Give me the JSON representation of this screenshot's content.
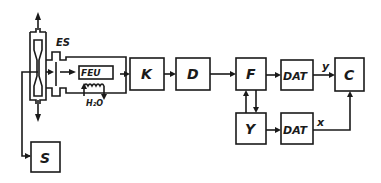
{
  "diagram": {
    "blocks": {
      "es": "ES",
      "feu": "FEU",
      "water": "H₂O",
      "k": "K",
      "d": "D",
      "f": "F",
      "dat_top": "DAT",
      "c": "C",
      "y": "Y",
      "dat_bottom": "DAT",
      "s": "S"
    },
    "signals": {
      "y_label": "y",
      "x_label": "x"
    },
    "colors": {
      "line": "#1a1a1a",
      "background": "#ffffff"
    }
  }
}
